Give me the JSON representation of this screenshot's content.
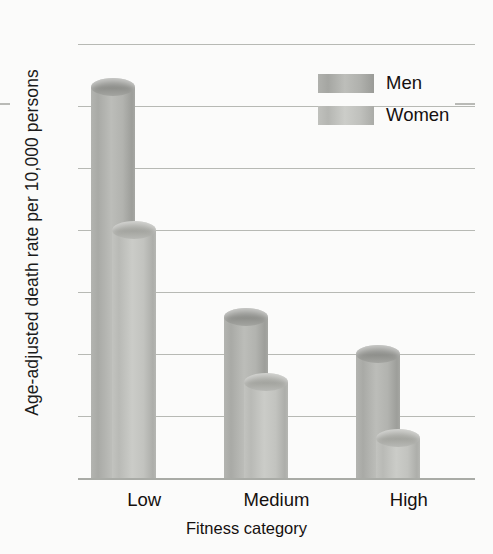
{
  "chart_data": {
    "type": "bar",
    "title": "",
    "subtitle": "",
    "xlabel": "Fitness category",
    "ylabel": "Age-adjusted death rate per 10,000 persons",
    "categories": [
      "Low",
      "Medium",
      "High"
    ],
    "series": [
      {
        "name": "Men",
        "values": [
          63,
          26,
          20
        ],
        "color": "#b0b1ad"
      },
      {
        "name": "Women",
        "values": [
          40,
          15.5,
          6.5
        ],
        "color": "#c0c1bd"
      }
    ],
    "ylim": [
      0,
      70
    ],
    "yticks": [
      0,
      10,
      20,
      30,
      40,
      50,
      60,
      70
    ],
    "ytick_labels": [
      "0",
      "10",
      "20",
      "30",
      "40",
      "50",
      "60",
      "70"
    ],
    "grid": true,
    "grid_axis": "y",
    "legend_position": "top-right",
    "bar_style": "3d-cylinder",
    "background_color": "#fbfbfa",
    "gridline_color": "#b7b9b4",
    "axis_color": "#a9aba6",
    "text_color": "#15100f"
  },
  "legend": {
    "entries": [
      {
        "label": "Men"
      },
      {
        "label": "Women"
      }
    ]
  }
}
